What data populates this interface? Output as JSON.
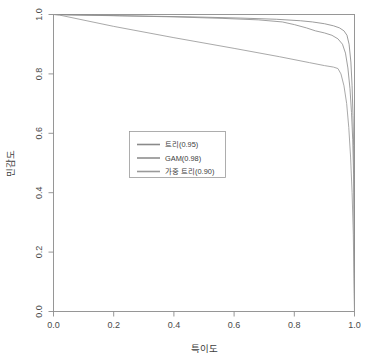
{
  "chart_data": {
    "type": "line",
    "title": "",
    "subtitle": "",
    "xlabel": "특이도",
    "ylabel": "민감도",
    "xlim": [
      0,
      1
    ],
    "ylim": [
      0,
      1
    ],
    "grid": false,
    "legend_position": "center-left",
    "xticks": [
      "0.0",
      "0.2",
      "0.4",
      "0.6",
      "0.8",
      "1.0"
    ],
    "xtick_values": [
      0.0,
      0.2,
      0.4,
      0.6,
      0.8,
      1.0
    ],
    "yticks": [
      "0.0",
      "0.2",
      "0.4",
      "0.6",
      "0.8",
      "1.0"
    ],
    "ytick_values": [
      0.0,
      0.2,
      0.4,
      0.6,
      0.8,
      1.0
    ],
    "series": [
      {
        "name": "트리(0.95)",
        "auc": 0.95,
        "color": "#8a8a8a",
        "x": [
          0.0,
          0.01,
          0.02,
          0.22,
          0.46,
          0.62,
          0.74,
          0.82,
          0.86,
          0.9,
          0.93,
          0.95,
          0.965,
          0.975,
          0.982,
          0.988,
          0.992,
          0.995,
          0.997,
          0.999,
          1.0,
          1.0
        ],
        "y": [
          1.0,
          1.0,
          1.0,
          0.996,
          0.992,
          0.988,
          0.984,
          0.979,
          0.975,
          0.969,
          0.962,
          0.955,
          0.945,
          0.93,
          0.9,
          0.84,
          0.76,
          0.66,
          0.56,
          0.4,
          0.04,
          0.0
        ]
      },
      {
        "name": "GAM(0.98)",
        "auc": 0.98,
        "color": "#8f8f8f",
        "x": [
          0.0,
          0.02,
          0.2,
          0.4,
          0.56,
          0.68,
          0.76,
          0.8,
          0.84,
          0.87,
          0.9,
          0.925,
          0.945,
          0.96,
          0.97,
          0.978,
          0.985,
          0.99,
          0.994,
          0.997,
          0.999,
          1.0
        ],
        "y": [
          1.0,
          0.999,
          0.996,
          0.992,
          0.987,
          0.982,
          0.975,
          0.966,
          0.955,
          0.945,
          0.938,
          0.93,
          0.918,
          0.9,
          0.87,
          0.82,
          0.75,
          0.67,
          0.58,
          0.46,
          0.2,
          0.0
        ]
      },
      {
        "name": "가중 트리(0.90)",
        "auc": 0.9,
        "color": "#9a9a9a",
        "x": [
          0.0,
          0.02,
          0.2,
          0.4,
          0.6,
          0.75,
          0.85,
          0.9,
          0.93,
          0.945,
          0.955,
          0.965,
          0.974,
          0.981,
          0.987,
          0.992,
          0.996,
          0.999,
          1.0
        ],
        "y": [
          1.0,
          0.998,
          0.96,
          0.922,
          0.886,
          0.858,
          0.838,
          0.828,
          0.823,
          0.818,
          0.8,
          0.76,
          0.7,
          0.62,
          0.52,
          0.4,
          0.26,
          0.06,
          0.0
        ]
      }
    ],
    "legend_entries": [
      {
        "label": "트리(0.95)",
        "color": "#8a8a8a"
      },
      {
        "label": "GAM(0.98)",
        "color": "#8f8f8f"
      },
      {
        "label": "가중 트리(0.90)",
        "color": "#9a9a9a"
      }
    ]
  }
}
